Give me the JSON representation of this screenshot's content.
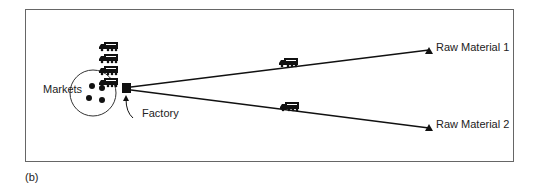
{
  "figure": {
    "caption": "(b)"
  },
  "nodes": {
    "markets": {
      "label": "Markets",
      "dots": 4
    },
    "factory": {
      "label": "Factory"
    },
    "raw_material_1": {
      "label": "Raw Material 1"
    },
    "raw_material_2": {
      "label": "Raw Material 2"
    }
  },
  "edges": [
    {
      "from": "Factory",
      "to": "Raw Material 1",
      "icon": "truck-icon"
    },
    {
      "from": "Factory",
      "to": "Raw Material 2",
      "icon": "truck-icon"
    }
  ],
  "market_trucks": {
    "count": 4,
    "icon": "truck-icon"
  },
  "colors": {
    "stroke": "#111111",
    "frame": "#555555",
    "text": "#222222"
  }
}
